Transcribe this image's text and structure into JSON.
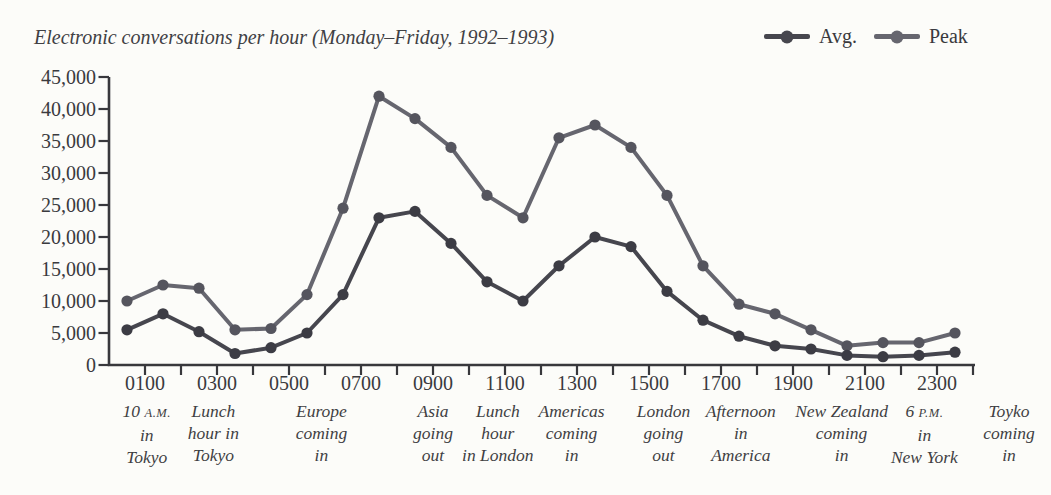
{
  "page_background": "#fcfcf9",
  "chart_data": {
    "type": "line",
    "title": "Electronic conversations per hour (Monday–Friday, 1992–1993)",
    "xlabel": "",
    "ylabel": "",
    "ylim": [
      0,
      45000
    ],
    "grid": false,
    "legend_position": "top-right",
    "y_ticks": [
      0,
      5000,
      10000,
      15000,
      20000,
      25000,
      30000,
      35000,
      40000,
      45000
    ],
    "x_axis": {
      "tick_every_hours": 1,
      "first_tick_hour": 1,
      "last_tick_hour": 24,
      "labeled_ticks": [
        {
          "label": "0100",
          "hour": 1
        },
        {
          "label": "0300",
          "hour": 3
        },
        {
          "label": "0500",
          "hour": 5
        },
        {
          "label": "0700",
          "hour": 7
        },
        {
          "label": "0900",
          "hour": 9
        },
        {
          "label": "1100",
          "hour": 11
        },
        {
          "label": "1300",
          "hour": 13
        },
        {
          "label": "1500",
          "hour": 15
        },
        {
          "label": "1700",
          "hour": 17
        },
        {
          "label": "1900",
          "hour": 19
        },
        {
          "label": "2100",
          "hour": 21
        },
        {
          "label": "2300",
          "hour": 23
        }
      ]
    },
    "x_start_hour": 0.5,
    "x_step_hours": 1,
    "series": [
      {
        "name": "Peak",
        "color": "#66666f",
        "dot_color": "#55555e",
        "values": [
          10000,
          12500,
          12000,
          5500,
          5700,
          11000,
          24500,
          42000,
          38500,
          34000,
          26500,
          23000,
          35500,
          37500,
          34000,
          26500,
          15500,
          9500,
          8000,
          5500,
          3000,
          3500,
          3500,
          5000
        ]
      },
      {
        "name": "Avg.",
        "color": "#46464e",
        "dot_color": "#3c3c44",
        "values": [
          5500,
          8000,
          5200,
          1800,
          2700,
          5000,
          11000,
          23000,
          24000,
          19000,
          13000,
          10000,
          15500,
          20000,
          18500,
          11500,
          7000,
          4500,
          3000,
          2500,
          1500,
          1300,
          1500,
          2000
        ]
      }
    ],
    "annotations": [
      {
        "hour": 1.05,
        "lines": [
          "10 A.M.",
          "in",
          "Tokyo"
        ]
      },
      {
        "hour": 2.9,
        "lines": [
          "Lunch",
          "hour in",
          "Tokyo"
        ]
      },
      {
        "hour": 5.9,
        "lines": [
          "Europe",
          "coming",
          "in"
        ]
      },
      {
        "hour": 9.0,
        "lines": [
          "Asia",
          "going",
          "out"
        ]
      },
      {
        "hour": 10.8,
        "lines": [
          "Lunch",
          "hour",
          "in London"
        ]
      },
      {
        "hour": 12.85,
        "lines": [
          "Americas",
          "coming",
          "in"
        ]
      },
      {
        "hour": 15.4,
        "lines": [
          "London",
          "going",
          "out"
        ]
      },
      {
        "hour": 17.55,
        "lines": [
          "Afternoon",
          "in",
          "America"
        ]
      },
      {
        "hour": 20.35,
        "lines": [
          "New Zealand",
          "coming",
          "in"
        ]
      },
      {
        "hour": 22.65,
        "lines": [
          "6 P.M.",
          "in",
          "New York"
        ]
      },
      {
        "hour": 25.0,
        "lines": [
          "Toyko",
          "coming",
          "in"
        ]
      }
    ]
  },
  "legend": {
    "items": [
      {
        "label": "Avg.",
        "color": "#46464e"
      },
      {
        "label": "Peak",
        "color": "#66666f"
      }
    ]
  },
  "axis_color": "#38383c"
}
